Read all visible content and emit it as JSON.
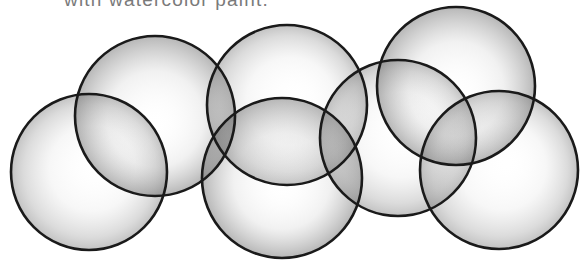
{
  "caption": {
    "text": "with watercolor paint."
  },
  "illustration": {
    "description": "Seven overlapping outlined circles shaded with grey watercolor-style gradients",
    "stroke_color": "#1a1a1a",
    "shade_color": "#6e6e6e",
    "highlight_color": "#ffffff",
    "circles": [
      {
        "id": "circle-1",
        "cx": 89,
        "cy": 172,
        "r": 78
      },
      {
        "id": "circle-2",
        "cx": 155,
        "cy": 116,
        "r": 80
      },
      {
        "id": "circle-3",
        "cx": 287,
        "cy": 105,
        "r": 80
      },
      {
        "id": "circle-4",
        "cx": 282,
        "cy": 178,
        "r": 80
      },
      {
        "id": "circle-5",
        "cx": 398,
        "cy": 138,
        "r": 78
      },
      {
        "id": "circle-6",
        "cx": 456,
        "cy": 86,
        "r": 79
      },
      {
        "id": "circle-7",
        "cx": 499,
        "cy": 170,
        "r": 79
      }
    ]
  }
}
